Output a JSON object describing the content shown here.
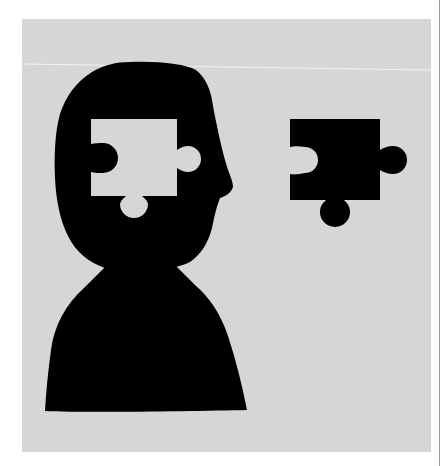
{
  "illustration": {
    "caption": "Silhouette of a head with a puzzle-piece-shaped hole, next to the matching black puzzle piece",
    "colors": {
      "page_background": "#ffffff",
      "panel_background": "#d6d6d6",
      "silhouette": "#000000",
      "crease_line": "#f2f2f2",
      "edge_line": "#9a9a9a"
    },
    "elements": {
      "person": "head-and-shoulders silhouette facing right",
      "missing_piece_hole": "puzzle-shaped gap in head",
      "puzzle_piece": "black jigsaw piece floating to the right"
    }
  }
}
